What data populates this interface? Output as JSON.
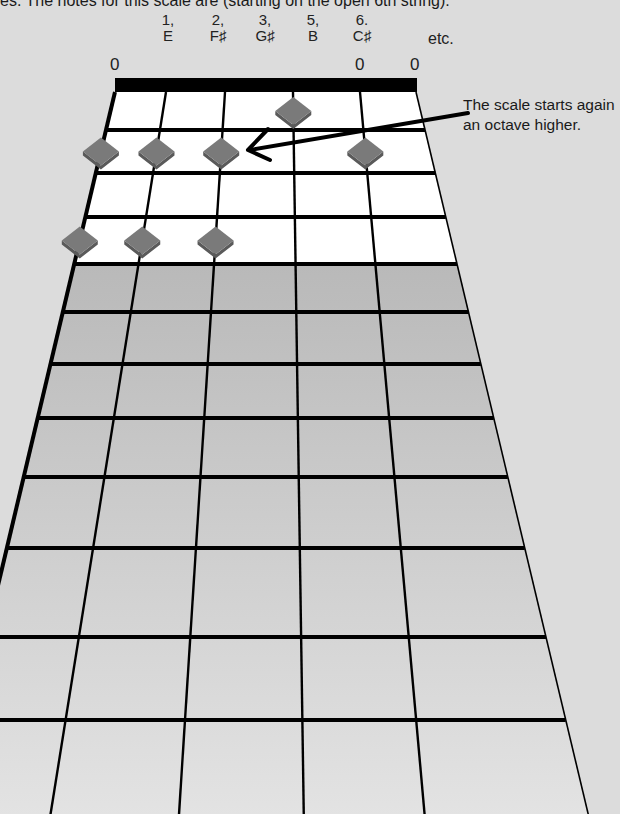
{
  "intro_text": "es. The notes for this scale are (starting on the open 6th string):",
  "scale_notes": [
    {
      "degree": "1,",
      "name": "E",
      "x": 168
    },
    {
      "degree": "2,",
      "name": "F♯",
      "x": 218
    },
    {
      "degree": "3,",
      "name": "G♯",
      "x": 265
    },
    {
      "degree": "5,",
      "name": "B",
      "x": 313
    },
    {
      "degree": "6.",
      "name": "C♯",
      "x": 362
    }
  ],
  "etc_label": "etc.",
  "open_string_markers": [
    {
      "label": "0",
      "x": 110
    },
    {
      "label": "0",
      "x": 355
    },
    {
      "label": "0",
      "x": 410
    }
  ],
  "callout": {
    "line1": "The scale starts again",
    "line2": "an octave higher."
  },
  "fretboard": {
    "strings": 6,
    "frets_shown": 12,
    "nut_color": "#000000",
    "fret_line_color": "#000000",
    "highlight_region_color": "#ffffff",
    "lower_region_color": "#c4c4c4",
    "marker_color": "#7a7a7a",
    "markers": [
      {
        "fret": 1,
        "string": 3,
        "note": "G♯"
      },
      {
        "fret": 2,
        "string": 6,
        "note": "C♯"
      },
      {
        "fret": 2,
        "string": 5,
        "note": "F♯"
      },
      {
        "fret": 2,
        "string": 4,
        "note": "B"
      },
      {
        "fret": 2,
        "string": 2,
        "note": "E (octave)"
      },
      {
        "fret": 4,
        "string": 6,
        "note": "G♯"
      },
      {
        "fret": 4,
        "string": 5,
        "note": "C♯"
      },
      {
        "fret": 4,
        "string": 4,
        "note": "F♯"
      }
    ]
  },
  "arrow": {
    "from": [
      468,
      115
    ],
    "to": [
      248,
      150
    ],
    "label": "octave-arrow"
  }
}
